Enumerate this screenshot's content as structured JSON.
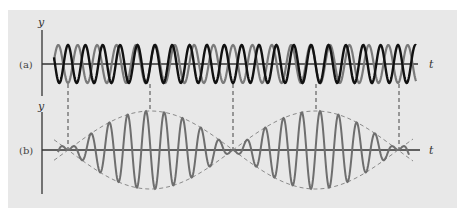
{
  "figure": {
    "panel_color": "#e8e8e8",
    "axis_color": "#333333",
    "wave1_color": "#111111",
    "wave2_color": "#7a7a7a",
    "sum_color": "#6e6e6e",
    "envelope_color": "#8a8a8a",
    "guide_color": "#444444"
  },
  "labels": {
    "panel_a": "(a)",
    "panel_b": "(b)",
    "y_axis_a": "y",
    "y_axis_b": "y",
    "t_axis_a": "t",
    "t_axis_b": "t"
  },
  "chart_data": {
    "type": "line",
    "panels": [
      {
        "id": "a",
        "label": "(a)",
        "xlabel": "t",
        "ylabel": "y",
        "series": [
          {
            "name": "wave 1 (dark)",
            "amplitude": 1.0,
            "cycles_per_beat": 9.5
          },
          {
            "name": "wave 2 (gray)",
            "amplitude": 1.0,
            "cycles_per_beat": 8.5
          }
        ]
      },
      {
        "id": "b",
        "label": "(b)",
        "xlabel": "t",
        "ylabel": "y",
        "series": [
          {
            "name": "resultant (sum)",
            "amplitude": 2.0,
            "cycles_per_beat": 9
          },
          {
            "name": "envelope (dashed)",
            "amplitude": 2.0
          }
        ]
      }
    ],
    "beat_nodes_x": [
      68,
      233,
      399
    ],
    "beat_antinodes_x": [
      150,
      316
    ],
    "grid": false,
    "legend": "none"
  }
}
